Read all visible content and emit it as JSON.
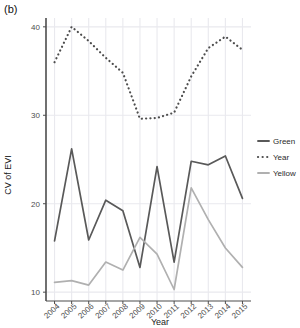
{
  "figure": {
    "panel_label": "(b)",
    "background": "#ffffff"
  },
  "chart_data": {
    "type": "line",
    "title": "",
    "xlabel": "Year",
    "ylabel": "CV of EVI",
    "categories": [
      "2004",
      "2005",
      "2006",
      "2007",
      "2008",
      "2009",
      "2010",
      "2011",
      "2012",
      "2013",
      "2014",
      "2015"
    ],
    "x": [
      2004,
      2005,
      2006,
      2007,
      2008,
      2009,
      2010,
      2011,
      2012,
      2013,
      2014,
      2015
    ],
    "xlim": [
      2003.5,
      2015.5
    ],
    "ylim": [
      9.0,
      41.0
    ],
    "yticks": [
      10,
      20,
      30,
      40
    ],
    "ytick_labels": [
      "10",
      "20",
      "30",
      "40"
    ],
    "xticks": [
      2004,
      2005,
      2006,
      2007,
      2008,
      2009,
      2010,
      2011,
      2012,
      2013,
      2014,
      2015
    ],
    "grid": true,
    "legend_position": "right",
    "series": [
      {
        "name": "Green",
        "style": "solid",
        "color": "#595959",
        "values": [
          15.8,
          26.2,
          15.9,
          20.4,
          19.2,
          12.8,
          24.2,
          13.4,
          24.8,
          24.4,
          25.4,
          20.6
        ]
      },
      {
        "name": "Year",
        "style": "dotted",
        "color": "#4d4d4d",
        "values": [
          36.0,
          40.0,
          38.4,
          36.5,
          34.8,
          29.6,
          29.7,
          30.3,
          34.4,
          37.6,
          38.9,
          37.4
        ]
      },
      {
        "name": "Yellow",
        "style": "solid",
        "color": "#b0b0b0",
        "values": [
          11.1,
          11.3,
          10.8,
          13.4,
          12.5,
          16.2,
          14.3,
          10.3,
          21.8,
          18.2,
          15.0,
          12.8
        ]
      }
    ]
  },
  "legend": {
    "entries": [
      {
        "label": "Green",
        "key": "green-key"
      },
      {
        "label": "Year",
        "key": "year-key"
      },
      {
        "label": "Yellow",
        "key": "yellow-key"
      }
    ]
  }
}
